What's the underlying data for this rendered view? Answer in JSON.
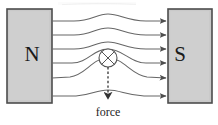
{
  "figure": {
    "background_color": "#ffffff",
    "width": 218,
    "height": 125
  },
  "magnets": {
    "north": {
      "label": "N",
      "fill_color": "#c9c9c9",
      "stroke_color": "#4d4d4d",
      "x": 7,
      "y": 9,
      "width": 45,
      "height": 94,
      "label_x": 32,
      "label_y": 55
    },
    "south": {
      "label": "S",
      "fill_color": "#c9c9c9",
      "stroke_color": "#4d4d4d",
      "x": 168,
      "y": 9,
      "width": 44,
      "height": 94,
      "label_x": 180,
      "label_y": 55
    }
  },
  "field": {
    "line_color": "#666666",
    "arrow_color": "#4d4d4d",
    "line_count": 6,
    "direction": "left-to-right",
    "lines": [
      {
        "name": "field-line-1",
        "y_left": 21,
        "y_right": 21,
        "bulge": -7
      },
      {
        "name": "field-line-2",
        "y_left": 35,
        "y_right": 35,
        "bulge": -7
      },
      {
        "name": "field-line-3",
        "y_left": 49,
        "y_right": 49,
        "bulge": -7
      },
      {
        "name": "field-line-4",
        "y_left": 63,
        "y_right": 63,
        "bulge": -14
      },
      {
        "name": "field-line-5",
        "y_left": 77,
        "y_right": 77,
        "bulge": -19
      },
      {
        "name": "field-line-6",
        "y_left": 96,
        "y_right": 96,
        "bulge": -6
      }
    ]
  },
  "conductor": {
    "name": "current-into-page-symbol",
    "symbol": "circle-with-cross",
    "meaning": "current into page",
    "center_x": 108,
    "center_y": 58,
    "radius": 9,
    "stroke_color": "#555555"
  },
  "force": {
    "label": "force",
    "direction": "downward",
    "line_style": "dashed",
    "color": "#333333",
    "start_x": 108,
    "start_y": 67,
    "end_x": 108,
    "end_y": 100,
    "label_x": 108,
    "label_y": 113
  }
}
